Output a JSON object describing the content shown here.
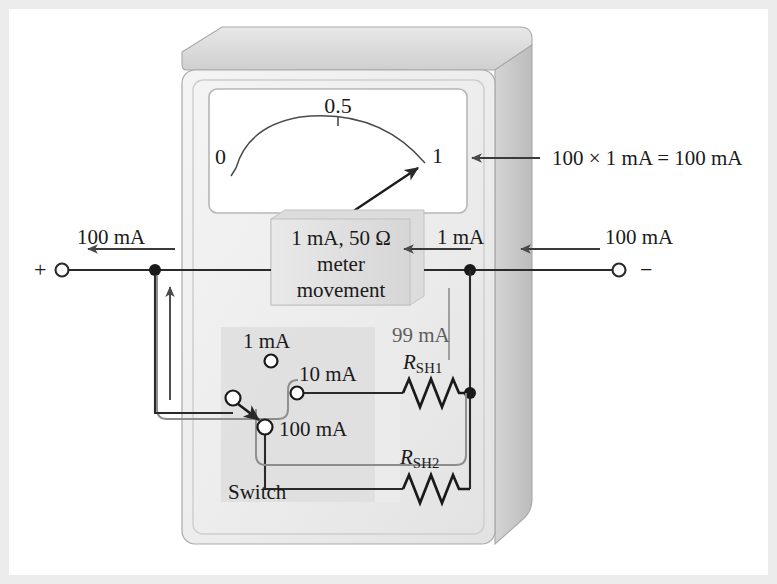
{
  "figure": {
    "type": "circuit-diagram"
  },
  "meter": {
    "movement_line1": "1 mA, 50 Ω",
    "movement_line2": "meter",
    "movement_line3": "movement",
    "scale_labels": [
      "0",
      "0.5",
      "1"
    ],
    "needle_value": "1"
  },
  "annotations": {
    "reading": "100 × 1 mA  = 100 mA",
    "left_current": "100 mA",
    "right_current": "100 mA",
    "movement_current": "1 mA",
    "shunt_current": "99 mA"
  },
  "terminals": {
    "positive": "+",
    "negative": "−"
  },
  "switch": {
    "label": "Switch",
    "positions": [
      "1 mA",
      "10 mA",
      "100 mA"
    ],
    "selected": "100 mA"
  },
  "resistors": [
    {
      "name": "R",
      "sub": "SH1"
    },
    {
      "name": "R",
      "sub": "SH2"
    }
  ],
  "colors": {
    "wire": "#2a2a2a",
    "body_face": "#efefef",
    "body_top": "#d9d9da",
    "body_side": "#c9c9ca",
    "panel": "#e3e3e3",
    "frame": "#ececed",
    "text": "#1a1a1a",
    "text_gray": "#5e5e5e"
  }
}
